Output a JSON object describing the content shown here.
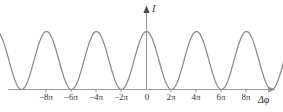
{
  "figure": {
    "kind": "interference-intensity-plot",
    "background_color": "#ffffff",
    "curve_color": "#8a8a8a",
    "axis_color": "#9a9a9a",
    "text_color": "#3a3a3a"
  },
  "axes": {
    "y_title": "I",
    "x_title": "Δφ"
  },
  "chart_data": {
    "type": "line",
    "title": "",
    "xlabel": "Δφ",
    "ylabel": "I",
    "grid": false,
    "legend": null,
    "xlim": [
      -9.5,
      9.8
    ],
    "ylim": [
      0,
      1.18
    ],
    "x_tick_values": [
      -8,
      -6,
      -4,
      -2,
      0,
      2,
      4,
      6,
      8
    ],
    "x_tick_labels": [
      "−8π",
      "−6π",
      "−4π",
      "−2π",
      "0",
      "2π",
      "4π",
      "6π",
      "8π"
    ],
    "y_tick_values": [],
    "y_tick_labels": [],
    "x_unit": "pi",
    "function": "I = I_max * cos(pi*x/2)^2",
    "period_in_pi_units": 2,
    "peak_count": 9,
    "peak_x_values": [
      -8,
      -6,
      -4,
      -2,
      0,
      2,
      4,
      6,
      8
    ],
    "peak_y_values": [
      1,
      1,
      1,
      1,
      1,
      1,
      1,
      1,
      1
    ],
    "minimum_x_values": [
      -9,
      -7,
      -5,
      -3,
      -1,
      1,
      3,
      5,
      7,
      9
    ],
    "minimum_y_values": [
      0,
      0,
      0,
      0,
      0,
      0,
      0,
      0,
      0,
      0
    ],
    "series": [
      {
        "name": "intensity",
        "x": [
          -9.4,
          -9.2,
          -9.0,
          -8.8,
          -8.6,
          -8.4,
          -8.2,
          -8.0,
          -7.8,
          -7.6,
          -7.4,
          -7.2,
          -7.0,
          -6.8,
          -6.6,
          -6.4,
          -6.2,
          -6.0,
          -5.8,
          -5.6,
          -5.4,
          -5.2,
          -5.0,
          -4.8,
          -4.6,
          -4.4,
          -4.2,
          -4.0,
          -3.8,
          -3.6,
          -3.4,
          -3.2,
          -3.0,
          -2.8,
          -2.6,
          -2.4,
          -2.2,
          -2.0,
          -1.8,
          -1.6,
          -1.4,
          -1.2,
          -1.0,
          -0.8,
          -0.6,
          -0.4,
          -0.2,
          0.0,
          0.2,
          0.4,
          0.6,
          0.8,
          1.0,
          1.2,
          1.4,
          1.6,
          1.8,
          2.0,
          2.2,
          2.4,
          2.6,
          2.8,
          3.0,
          3.2,
          3.4,
          3.6,
          3.8,
          4.0,
          4.2,
          4.4,
          4.6,
          4.8,
          5.0,
          5.2,
          5.4,
          5.6,
          5.8,
          6.0,
          6.2,
          6.4,
          6.6,
          6.8,
          7.0,
          7.2,
          7.4,
          7.6,
          7.8,
          8.0,
          8.2,
          8.4,
          8.6,
          8.8,
          9.0,
          9.2
        ],
        "y": [
          0.38,
          0.21,
          0.1,
          0.02,
          0.02,
          0.1,
          0.21,
          0.38,
          0.21,
          0.1,
          0.02,
          0.02,
          0.1,
          0.21,
          0.38,
          0.58,
          0.79,
          1.0,
          0.79,
          0.58,
          0.38,
          0.21,
          0.0,
          0.1,
          0.38,
          0.58,
          0.79,
          1.0,
          0.79,
          0.58,
          0.38,
          0.1,
          0.0,
          0.1,
          0.38,
          0.58,
          0.79,
          1.0,
          0.79,
          0.58,
          0.38,
          0.1,
          0.0,
          0.1,
          0.38,
          0.58,
          0.9,
          1.0,
          0.9,
          0.58,
          0.38,
          0.1,
          0.0,
          0.1,
          0.38,
          0.58,
          0.79,
          1.0,
          0.79,
          0.58,
          0.38,
          0.1,
          0.0,
          0.1,
          0.38,
          0.58,
          0.79,
          1.0,
          0.79,
          0.58,
          0.38,
          0.1,
          0.0,
          0.1,
          0.38,
          0.58,
          0.79,
          1.0,
          0.79,
          0.58,
          0.38,
          0.1,
          0.0,
          0.1,
          0.38,
          0.58,
          0.79,
          1.0,
          0.79,
          0.58,
          0.38,
          0.21,
          0.1,
          0.06
        ]
      }
    ]
  },
  "ticks": [
    {
      "label": "−8π",
      "x_px": 46
    },
    {
      "label": "−6π",
      "x_px": 71
    },
    {
      "label": "−4π",
      "x_px": 96
    },
    {
      "label": "−2π",
      "x_px": 121
    },
    {
      "label": "0",
      "x_px": 146
    },
    {
      "label": "2π",
      "x_px": 171
    },
    {
      "label": "4π",
      "x_px": 196
    },
    {
      "label": "6π",
      "x_px": 221
    },
    {
      "label": "8π",
      "x_px": 246
    }
  ]
}
